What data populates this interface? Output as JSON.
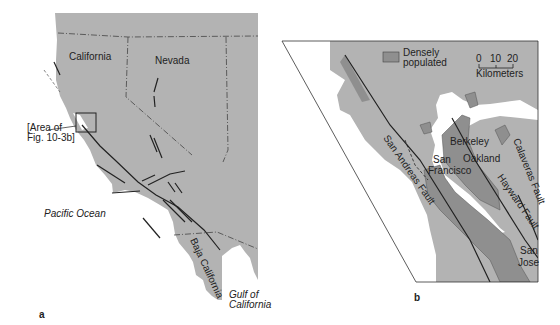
{
  "colors": {
    "land": "#b3b3b3",
    "dense": "#8f8f8f",
    "water": "#ffffff",
    "line": "#222222"
  },
  "panel_a": {
    "label": "a",
    "states": [
      "California",
      "Nevada"
    ],
    "ocean": "Pacific Ocean",
    "peninsula": "Baja California",
    "gulf_line1": "Gulf of",
    "gulf_line2": "California",
    "callout_line1": "[Area of",
    "callout_line2": "Fig. 10-3b]"
  },
  "panel_b": {
    "label": "b",
    "legend": {
      "line1": "Densely",
      "line2": "populated"
    },
    "scale": {
      "ticks": [
        "0",
        "10",
        "20"
      ],
      "unit": "Kilometers"
    },
    "cities": [
      "Berkeley",
      "Oakland",
      "San",
      "Francisco",
      "San",
      "Jose"
    ],
    "faults": [
      "San Andreas Fault",
      "Hayward Fault",
      "Calaveras Fault"
    ]
  }
}
